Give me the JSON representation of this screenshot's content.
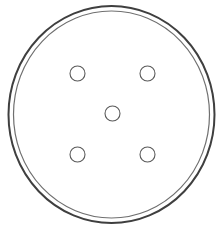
{
  "diagram": {
    "type": "petri-dish-well-layout",
    "plate": {
      "rim_count": 2,
      "outer_rim_color": "#3f3f3f",
      "inner_rim_color": "#6f6f6f",
      "fill_color": "#ffffff"
    },
    "wells": {
      "count": 5,
      "pattern": "quincunx",
      "stroke_color": "#5a5a5a",
      "fill_color": "#ffffff",
      "items": [
        {
          "id": "top-left"
        },
        {
          "id": "top-right"
        },
        {
          "id": "center"
        },
        {
          "id": "bottom-left"
        },
        {
          "id": "bottom-right"
        }
      ]
    }
  }
}
